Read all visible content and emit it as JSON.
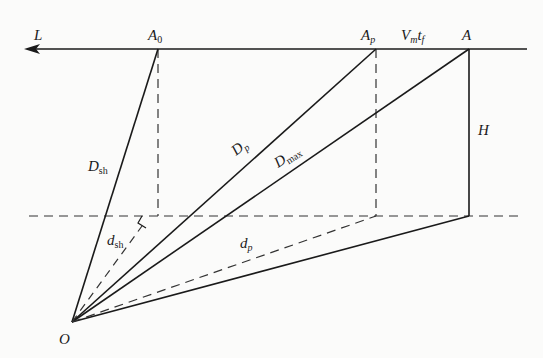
{
  "diagram": {
    "colors": {
      "stroke": "#1a1a1a",
      "background": "#fbfbfa"
    },
    "labels": {
      "L": "L",
      "A0_main": "A",
      "A0_sub": "0",
      "Ap_main": "A",
      "Ap_sub": "p",
      "Vmtf_V": "V",
      "Vmtf_m": "m",
      "Vmtf_t": "t",
      "Vmtf_f": "f",
      "A": "A",
      "H": "H",
      "Dsh_main": "D",
      "Dsh_sub": "sh",
      "dsh_main": "d",
      "dsh_sub": "sh",
      "Dp_main": "D",
      "Dp_sub": "p",
      "Dmax_main": "D",
      "Dmax_sub": "max",
      "dp_main": "d",
      "dp_sub": "p",
      "O": "O"
    },
    "points": {
      "O": [
        72,
        322
      ],
      "A0": [
        158,
        49
      ],
      "Ap": [
        376,
        49
      ],
      "A": [
        469,
        49
      ],
      "A_base": [
        469,
        216
      ],
      "Ap_base": [
        376,
        216
      ],
      "A0_base": [
        158,
        216
      ]
    }
  }
}
